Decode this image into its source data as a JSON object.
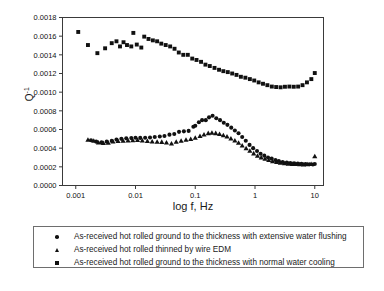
{
  "chart_data": {
    "type": "scatter",
    "title": "",
    "xlabel": "log f, Hz",
    "ylabel": "Q-1",
    "ylabel_base": "Q",
    "ylabel_exp": "-1",
    "xscale": "log",
    "xlim": [
      0.0006,
      14
    ],
    "ylim": [
      0.0,
      0.0018
    ],
    "grid": false,
    "legend_position": "below-plot",
    "xticks": [
      0.001,
      0.01,
      0.1,
      1,
      10
    ],
    "xticklabels": [
      "0.001",
      "0.01",
      "0.1",
      "1",
      "10"
    ],
    "yticks": [
      0.0,
      0.0002,
      0.0004,
      0.0006,
      0.0008,
      0.001,
      0.0012,
      0.0014,
      0.0016,
      0.0018
    ],
    "yticklabels": [
      "0.0000",
      "0.0002",
      "0.0004",
      "0.0006",
      "0.0008",
      "0.0010",
      "0.0012",
      "0.0014",
      "0.0016",
      "0.0018"
    ],
    "series": [
      {
        "name": "As-received hot rolled ground to the thickness with extensive water flushing",
        "marker": "circle",
        "color": "#111111",
        "points": [
          [
            0.0018,
            0.000485
          ],
          [
            0.0022,
            0.00047
          ],
          [
            0.0027,
            0.000462
          ],
          [
            0.0033,
            0.00047
          ],
          [
            0.004,
            0.000478
          ],
          [
            0.0048,
            0.000492
          ],
          [
            0.0058,
            0.0005
          ],
          [
            0.007,
            0.000505
          ],
          [
            0.0085,
            0.000508
          ],
          [
            0.01,
            0.000512
          ],
          [
            0.012,
            0.00051
          ],
          [
            0.0145,
            0.000512
          ],
          [
            0.0175,
            0.000515
          ],
          [
            0.021,
            0.00052
          ],
          [
            0.0255,
            0.000525
          ],
          [
            0.0305,
            0.00053
          ],
          [
            0.037,
            0.000545
          ],
          [
            0.0445,
            0.000552
          ],
          [
            0.0535,
            0.000575
          ],
          [
            0.0645,
            0.00058
          ],
          [
            0.0775,
            0.000585
          ],
          [
            0.093,
            0.00063
          ],
          [
            0.1,
            0.00064
          ],
          [
            0.115,
            0.000678
          ],
          [
            0.13,
            0.0007
          ],
          [
            0.15,
            0.0007
          ],
          [
            0.17,
            0.00073
          ],
          [
            0.195,
            0.000748
          ],
          [
            0.225,
            0.00072
          ],
          [
            0.26,
            0.0007
          ],
          [
            0.3,
            0.000672
          ],
          [
            0.345,
            0.00065
          ],
          [
            0.4,
            0.00062
          ],
          [
            0.46,
            0.00059
          ],
          [
            0.53,
            0.00056
          ],
          [
            0.61,
            0.00052
          ],
          [
            0.7,
            0.00048
          ],
          [
            0.81,
            0.000435
          ],
          [
            0.93,
            0.0004
          ],
          [
            1.08,
            0.00037
          ],
          [
            1.24,
            0.00034
          ],
          [
            1.43,
            0.00032
          ],
          [
            1.65,
            0.0003
          ],
          [
            1.9,
            0.000288
          ],
          [
            2.2,
            0.000272
          ],
          [
            2.5,
            0.000262
          ],
          [
            2.9,
            0.000252
          ],
          [
            3.4,
            0.000245
          ],
          [
            3.9,
            0.00024
          ],
          [
            4.5,
            0.000238
          ],
          [
            5.2,
            0.000235
          ],
          [
            6.0,
            0.000233
          ],
          [
            7.0,
            0.00023
          ],
          [
            8.1,
            0.000228
          ],
          [
            9.3,
            0.000225
          ],
          [
            10.0,
            0.00023
          ]
        ]
      },
      {
        "name": "As-received hot rolled thinned by wire EDM",
        "marker": "triangle",
        "color": "#111111",
        "points": [
          [
            0.0016,
            0.000492
          ],
          [
            0.002,
            0.00048
          ],
          [
            0.0024,
            0.000462
          ],
          [
            0.0029,
            0.000455
          ],
          [
            0.0035,
            0.000458
          ],
          [
            0.0042,
            0.000472
          ],
          [
            0.0051,
            0.000478
          ],
          [
            0.0062,
            0.00048
          ],
          [
            0.0075,
            0.000482
          ],
          [
            0.009,
            0.000485
          ],
          [
            0.0108,
            0.000488
          ],
          [
            0.013,
            0.000482
          ],
          [
            0.0158,
            0.000478
          ],
          [
            0.019,
            0.000472
          ],
          [
            0.023,
            0.00047
          ],
          [
            0.0275,
            0.000468
          ],
          [
            0.033,
            0.000462
          ],
          [
            0.04,
            0.00045
          ],
          [
            0.048,
            0.00047
          ],
          [
            0.058,
            0.00048
          ],
          [
            0.07,
            0.00049
          ],
          [
            0.084,
            0.0005
          ],
          [
            0.1,
            0.000512
          ],
          [
            0.12,
            0.00053
          ],
          [
            0.14,
            0.000548
          ],
          [
            0.165,
            0.000562
          ],
          [
            0.19,
            0.000565
          ],
          [
            0.22,
            0.000562
          ],
          [
            0.255,
            0.000552
          ],
          [
            0.295,
            0.00054
          ],
          [
            0.34,
            0.000525
          ],
          [
            0.395,
            0.000505
          ],
          [
            0.46,
            0.000482
          ],
          [
            0.53,
            0.000458
          ],
          [
            0.61,
            0.00043
          ],
          [
            0.71,
            0.0004
          ],
          [
            0.82,
            0.000372
          ],
          [
            0.95,
            0.000345
          ],
          [
            1.1,
            0.00032
          ],
          [
            1.27,
            0.000302
          ],
          [
            1.47,
            0.000288
          ],
          [
            1.7,
            0.000275
          ],
          [
            1.97,
            0.000262
          ],
          [
            2.3,
            0.000252
          ],
          [
            2.65,
            0.000245
          ],
          [
            3.1,
            0.00024
          ],
          [
            3.6,
            0.000235
          ],
          [
            4.2,
            0.000232
          ],
          [
            4.8,
            0.00023
          ],
          [
            5.6,
            0.000228
          ],
          [
            6.5,
            0.000226
          ],
          [
            7.5,
            0.000228
          ],
          [
            8.7,
            0.000232
          ],
          [
            10.0,
            0.000315
          ]
        ]
      },
      {
        "name": "As-received hot rolled ground to the thickness with normal water cooling",
        "marker": "square",
        "color": "#111111",
        "points": [
          [
            0.0011,
            0.001645
          ],
          [
            0.0016,
            0.001505
          ],
          [
            0.0023,
            0.001418
          ],
          [
            0.0031,
            0.00147
          ],
          [
            0.004,
            0.001525
          ],
          [
            0.0048,
            0.001545
          ],
          [
            0.0055,
            0.00149
          ],
          [
            0.0063,
            0.001535
          ],
          [
            0.0072,
            0.001505
          ],
          [
            0.0085,
            0.00149
          ],
          [
            0.0092,
            0.001635
          ],
          [
            0.0105,
            0.00151
          ],
          [
            0.0125,
            0.001478
          ],
          [
            0.014,
            0.001595
          ],
          [
            0.0165,
            0.00157
          ],
          [
            0.0195,
            0.001555
          ],
          [
            0.023,
            0.001545
          ],
          [
            0.027,
            0.00152
          ],
          [
            0.032,
            0.001505
          ],
          [
            0.038,
            0.00149
          ],
          [
            0.045,
            0.001465
          ],
          [
            0.053,
            0.001425
          ],
          [
            0.063,
            0.0014
          ],
          [
            0.075,
            0.0014
          ],
          [
            0.089,
            0.00136
          ],
          [
            0.105,
            0.001345
          ],
          [
            0.125,
            0.001325
          ],
          [
            0.148,
            0.001295
          ],
          [
            0.175,
            0.00128
          ],
          [
            0.21,
            0.00126
          ],
          [
            0.25,
            0.00124
          ],
          [
            0.295,
            0.001225
          ],
          [
            0.35,
            0.001215
          ],
          [
            0.415,
            0.0012
          ],
          [
            0.49,
            0.001185
          ],
          [
            0.58,
            0.001165
          ],
          [
            0.69,
            0.001155
          ],
          [
            0.82,
            0.00114
          ],
          [
            0.97,
            0.001125
          ],
          [
            1.15,
            0.001105
          ],
          [
            1.36,
            0.00109
          ],
          [
            1.61,
            0.001075
          ],
          [
            1.91,
            0.00106
          ],
          [
            2.26,
            0.001055
          ],
          [
            2.68,
            0.001052
          ],
          [
            3.17,
            0.001058
          ],
          [
            3.76,
            0.00106
          ],
          [
            4.45,
            0.001058
          ],
          [
            5.27,
            0.00106
          ],
          [
            6.24,
            0.001075
          ],
          [
            7.4,
            0.001105
          ],
          [
            8.76,
            0.00114
          ],
          [
            10.0,
            0.001205
          ]
        ]
      }
    ]
  },
  "legend": {
    "entries": [
      {
        "marker": "circle",
        "label": "As-received hot rolled ground to the thickness with extensive water flushing"
      },
      {
        "marker": "triangle",
        "label": "As-received hot rolled thinned by wire EDM"
      },
      {
        "marker": "square",
        "label": "As-received hot rolled ground to the thickness with normal water cooling"
      }
    ]
  }
}
